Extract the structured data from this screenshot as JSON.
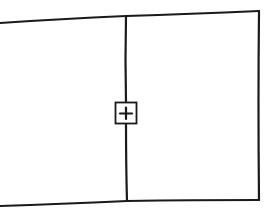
{
  "diagram": {
    "type": "wireframe-sketch",
    "panes": [
      {
        "name": "left-pane"
      },
      {
        "name": "right-pane"
      }
    ],
    "handle": {
      "icon": "plus-icon",
      "glyph": "+"
    },
    "stroke_color": "#1a1a1a",
    "background": "#ffffff"
  }
}
